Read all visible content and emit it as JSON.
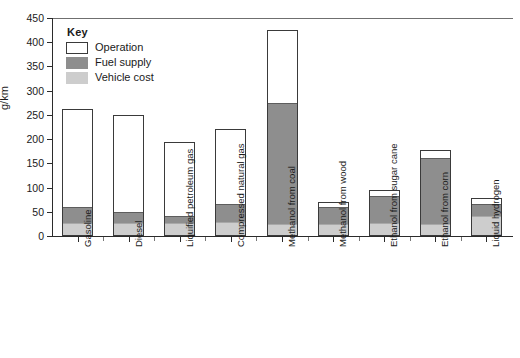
{
  "chart_data": {
    "type": "bar",
    "stacked": true,
    "title": "",
    "xlabel": "",
    "ylabel": "g/km",
    "ylim": [
      0,
      450
    ],
    "ytick_step": 50,
    "yticks": [
      "450",
      "400",
      "350",
      "300",
      "250",
      "200",
      "150",
      "100",
      "50",
      "0"
    ],
    "grid": false,
    "legend_position": "top-left",
    "legend_title": "Key",
    "categories": [
      "Gasoline",
      "Diesel",
      "Liquified petroleum gas",
      "Compressed natural gas",
      "Methanol from coal",
      "Methanol from wood",
      "Ethanol from sugar cane",
      "Ethanol from corn",
      "Liquid hydrogen"
    ],
    "series": [
      {
        "name": "Vehicle cost",
        "color": "#cdcdcd",
        "values": [
          25,
          25,
          24,
          26,
          22,
          22,
          25,
          23,
          40
        ]
      },
      {
        "name": "Fuel supply",
        "color": "#8e8e8e",
        "values": [
          32,
          23,
          16,
          39,
          251,
          36,
          55,
          137,
          23
        ]
      },
      {
        "name": "Operation",
        "color": "#ffffff",
        "values": [
          206,
          202,
          155,
          155,
          152,
          13,
          16,
          18,
          15
        ]
      }
    ],
    "totals": [
      263,
      250,
      195,
      220,
      425,
      71,
      96,
      178,
      78
    ]
  },
  "legend": {
    "title": "Key",
    "entries": [
      {
        "label": "Operation",
        "swatch": "operation-swatch"
      },
      {
        "label": "Fuel supply",
        "swatch": "fuel-supply-swatch"
      },
      {
        "label": "Vehicle cost",
        "swatch": "vehicle-cost-swatch"
      }
    ]
  },
  "axes": {
    "y_label": "g/km",
    "y_ticks": [
      "450",
      "400",
      "350",
      "300",
      "250",
      "200",
      "150",
      "100",
      "50",
      "0"
    ]
  },
  "colors": {
    "operation": "#ffffff",
    "fuel_supply": "#8e8e8e",
    "vehicle_cost": "#cdcdcd",
    "axis": "#2b2b2b",
    "bar_outline": "#3a3a3a",
    "background": "#ffffff"
  }
}
